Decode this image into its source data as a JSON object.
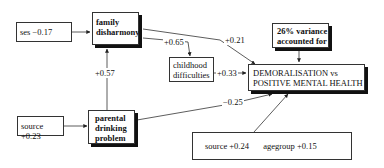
{
  "diagram": {
    "type": "path-model",
    "nodes": {
      "ses": {
        "label": "ses −0.17"
      },
      "family_disharmony": {
        "lines": [
          "family",
          "disharmony"
        ]
      },
      "childhood_difficulties": {
        "lines": [
          "childhood",
          "difficulties"
        ]
      },
      "variance": {
        "lines": [
          "26% variance",
          "accounted for"
        ]
      },
      "outcome": {
        "lines": [
          "DEMORALISATION vs",
          "POSITIVE MENTAL HEALTH"
        ]
      },
      "source_parent": {
        "label": "source +0.23"
      },
      "parental_drinking": {
        "lines": [
          "parental",
          "drinking",
          "problem"
        ]
      },
      "covariates": {
        "source": "source +0.24",
        "agegroup": "agegroup +0.15"
      }
    },
    "edges": [
      {
        "from": "ses",
        "to": "family_disharmony",
        "label": ""
      },
      {
        "from": "family_disharmony",
        "to": "childhood_difficulties",
        "label": "+0.65"
      },
      {
        "from": "family_disharmony",
        "to": "outcome",
        "label": "+0.21"
      },
      {
        "from": "childhood_difficulties",
        "to": "outcome",
        "label": "+0.33"
      },
      {
        "from": "parental_drinking",
        "to": "family_disharmony",
        "label": "+0.57"
      },
      {
        "from": "parental_drinking",
        "to": "outcome",
        "label": "−0.25"
      },
      {
        "from": "source_parent",
        "to": "parental_drinking",
        "label": ""
      },
      {
        "from": "variance",
        "to": "outcome",
        "label": ""
      },
      {
        "from": "covariates",
        "to": "outcome",
        "label": ""
      }
    ],
    "edge_labels": {
      "fd_cd": "+0.65",
      "fd_out": "+0.21",
      "cd_out": "+0.33",
      "pd_fd": "+0.57",
      "pd_out": "−0.25"
    }
  }
}
